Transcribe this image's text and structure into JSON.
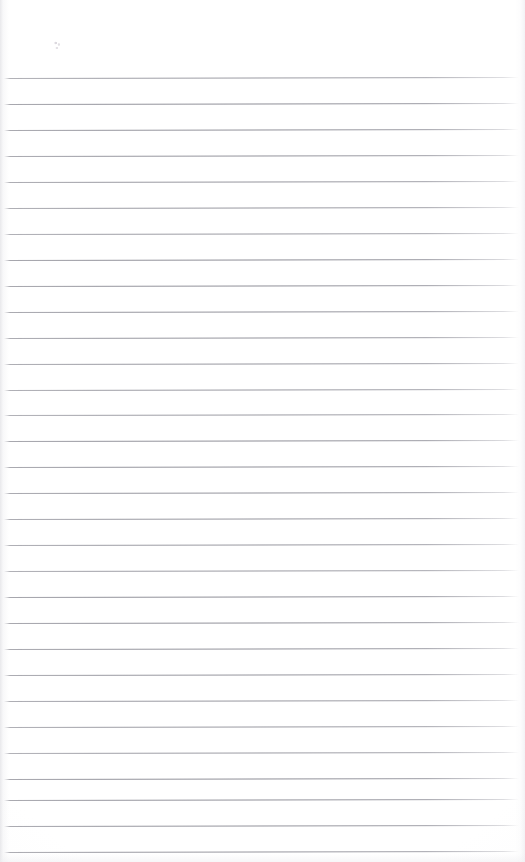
{
  "page": {
    "kind": "scanned-lined-notebook-page",
    "title": "",
    "width": 525,
    "height": 862,
    "background_color": "#ffffff",
    "content_text": "",
    "is_blank": true,
    "note": ""
  },
  "ruling": {
    "line_color": "#8a8a93",
    "line_thickness_px": 1,
    "line_spacing_px": 26,
    "first_line_y": 78,
    "last_line_y": 858,
    "line_left_x": 4,
    "line_right_x": 519,
    "line_count": 31,
    "tilt_degrees": -0.12,
    "top_margin_height": 74,
    "lines_y": [
      78,
      104,
      130,
      156,
      182,
      208,
      234,
      260,
      286,
      312,
      338,
      364,
      390,
      415,
      441,
      467,
      493,
      519,
      545,
      571,
      597,
      623,
      649,
      675,
      701,
      727,
      753,
      779,
      800,
      826,
      852
    ]
  },
  "rows": {
    "labels": [
      "",
      "",
      "",
      "",
      "",
      "",
      "",
      "",
      "",
      "",
      "",
      "",
      "",
      "",
      "",
      "",
      "",
      "",
      "",
      "",
      "",
      "",
      "",
      "",
      "",
      "",
      "",
      "",
      "",
      "",
      ""
    ]
  },
  "artifacts": {
    "speck": {
      "x": 54,
      "y": 40,
      "label": ""
    },
    "edge_shadow_left": "#d6d6db",
    "edge_shadow_right": "#e4e4e9",
    "paper_tint": "#fafafb"
  }
}
